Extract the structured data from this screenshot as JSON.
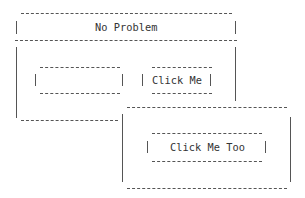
{
  "main_window": {
    "title": "No Problem",
    "text_input": {
      "value": "",
      "placeholder": ""
    },
    "button": {
      "label": "Click Me"
    }
  },
  "popup_window": {
    "button": {
      "label": "Click Me Too"
    }
  },
  "colors": {
    "background": "#ffffff",
    "text": "#333333",
    "border": "#555555"
  }
}
